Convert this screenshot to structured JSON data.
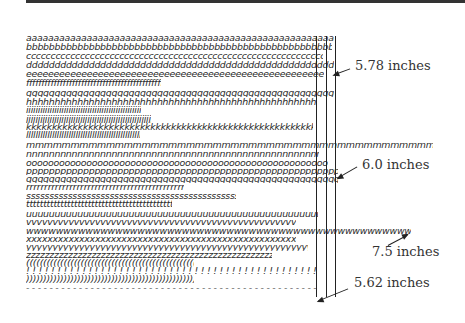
{
  "figure": {
    "top_rule": true,
    "annotations": {
      "label_578": "5.78 inches",
      "label_60": "6.0 inches",
      "label_75": "7.5 inches",
      "label_562": "5.62 inches"
    },
    "rows": [
      {
        "char": "a",
        "text": "aaaaaaaaaaaaaaaaaaaaaaaaaaaaaaaaaaaaaaaaaaaaaaaaaaaaaaaaaaaaaaaaaaaaaaaaaa",
        "width": 308
      },
      {
        "char": "b",
        "text": "bbbbbbbbbbbbbbbbbbbbbbbbbbbbbbbbbbbbbbbbbbbbbbbbbbbbbbbbbbbbbbbbbbbbbbbbbbbb",
        "width": 306
      },
      {
        "char": "c",
        "text": "cccccccccccccccccccccccccccccccccccccccccccccccccccccccccccccccccccccccccccccc.",
        "width": 297
      },
      {
        "char": "d",
        "text": "dddddddddddddddddddddddddddddddddddddddddddddddddddddddddddddddddddddddddddddd",
        "width": 308
      },
      {
        "char": "e",
        "text": "eeeeeeeeeeeeeeeeeeeeeeeeeeeeeeeeeeeeeeeeeeeeeeeeeeeeeeeeeeeeeeeeeeeeeeeeeeeee.",
        "width": 298
      },
      {
        "char": "f",
        "text": "ffffffffffffffffffffffffffffffffffffffffffffffffffffffffffffffffffffffffff.",
        "width": 135
      },
      {
        "char": "g",
        "text": "gggggggggggggggggggggggggggggggggggggggggggggggggggggggggggggggggggggggggggggg",
        "width": 308
      },
      {
        "char": "h",
        "text": "hhhhhhhhhhhhhhhhhhhhhhhhhhhhhhhhhhhhhhhhhhhhhhhhhhhhhhhhhhhhhhhhhhhhhhhhhhh.",
        "width": 290
      },
      {
        "char": "i",
        "text": "iiiiiiiiiiiiiiiiiiiiiiiiiiiiiiiiiiiiiiiiiiiiiiiiiiiiiiiiiiiiiiiiiiiiiiiiiiiiiiiii.",
        "width": 115
      },
      {
        "char": "j",
        "text": "jjjjjjjjjjjjjjjjjjjjjjjjjjjjjjjjjjjjjjjjjjjjjjjjjjjjjjjjjjjjjjjjjjjjjjjjjj.",
        "width": 125
      },
      {
        "char": "k",
        "text": "kkkkkkkkkkkkkkkkkkkkkkkkkkkkkkkkkkkkkkkkkkkkkkkkkkkkkkkkkkkkkkkkkkkkkkkkkk.",
        "width": 287
      },
      {
        "char": "l",
        "text": "llllllllllllllllllllllllllllllllllllllllllllllllllllllllllllllllllllllllllllllllllll.",
        "width": 114
      },
      {
        "char": "m",
        "text": "mmmmmmmmmmmmmmmmmmmmmmmmmmmmmmmmmmmmmmmmmmmmmmmmmmmmmmmmmmmmmmmmmmmmmmmmmmm",
        "width": 407
      },
      {
        "char": "n",
        "text": "nnnnnnnnnnnnnnnnnnnnnnnnnnnnnnnnnnnnnnnnnnnnnnnnnnnnnnnnnnnnnnnnnnnnnnnnnnn.",
        "width": 293
      },
      {
        "char": "o",
        "text": "oooooooooooooooooooooooooooooooooooooooooooooooooooooooooooooooooooooooooooooo",
        "width": 302
      },
      {
        "char": "p",
        "text": "pppppppppppppppppppppppppppppppppppppppppppppppppppppppppppppppppppppppppppppp",
        "width": 312
      },
      {
        "char": "q",
        "text": "qqqqqqqqqqqqqqqqqqqqqqqqqqqqqqqqqqqqqqqqqqqqqqqqqqqqqqqqqqqqqqqqqqqqqqqqqqqqqq",
        "width": 312
      },
      {
        "char": "r",
        "text": "rrrrrrrrrrrrrrrrrrrrrrrrrrrrrrrrrrrrrrrrrrrrrrrrrrrrrrrrrrrrrrrrrrrrrrrrrrr.",
        "width": 158
      },
      {
        "char": "s",
        "text": "ssssssssssssssssssssssssssssssssssssssssssssssssssssssssssssssssssssssssssss.",
        "width": 210
      },
      {
        "char": "t",
        "text": "tttttttttttttttttttttttttttttttttttttttttttttttttttttttttttttttttttttttttttttt.",
        "width": 146
      },
      {
        "char": "u",
        "text": "uuuuuuuuuuuuuuuuuuuuuuuuuuuuuuuuuuuuuuuuuuuuuuuuuuuuuuuuuuuuuuuuuuuuuuuuuuuuu",
        "width": 292
      },
      {
        "char": "v",
        "text": "vvvvvvvvvvvvvvvvvvvvvvvvvvvvvvvvvvvvvvvvvvvvvvvvvvvvvvvvvvvvvvvvvvvvvvvvvvvv.",
        "width": 270
      },
      {
        "char": "w",
        "text": "wwwwwwwwwwwwwwwwwwwwwwwwwwwwwwwwwwwwwwwwwwwwwwwwwwwwwwwwwwwwwwwwwwwwwwwwwwww",
        "width": 385
      },
      {
        "char": "x",
        "text": "xxxxxxxxxxxxxxxxxxxxxxxxxxxxxxxxxxxxxxxxxxxxxxxxxxxxxxxxxxxxxxxxxxxxxxxxxxxxx.",
        "width": 270
      },
      {
        "char": "y",
        "text": "yyyyyyyyyyyyyyyyyyyyyyyyyyyyyyyyyyyyyyyyyyyyyyyyyyyyyyyyyyyyyyyyyyyyyyyyyyyyy.",
        "width": 282
      },
      {
        "char": "z",
        "text": "zzzzzzzzzzzzzzzzzzzzzzzzzzzzzzzzzzzzzzzzzzzzzzzzzzzzzzzzzzzzzzzzzzzzzzzzzzzz.",
        "width": 246
      },
      {
        "char": "(",
        "text": "((((((((((((((((((((((((((((((((((((((((((((((((((((((((((((((((((((((((((((((((.",
        "width": 168
      },
      {
        "char": "!",
        "text": "! ! ! ! ! ! ! ! ! ! ! ! ! ! ! ! ! ! ! ! ! ! ! ! ! ! ! ! ! ! ! ! ! ! ! ! ! ! ! ! ! ! ! ! ! ! ! ! ! ! ! ! ! ! ! ! ! ! ! ! ! ! ! ! ! ! ! ! ! !",
        "width": 290
      },
      {
        "char": ")",
        "text": ")))))))))))))))))))))))))))))))))))))))))))))))))))))))))))))))))))))))))))))))).",
        "width": 168
      },
      {
        "char": "-",
        "text": "- - - - - - - - - - - - - - - - - - - - - - - - - - - - - - - - - - - - - - - - - - - - - - - - - - - - - - - - - - - - - - - - - - - - - - - - - -",
        "width": 290
      }
    ]
  }
}
